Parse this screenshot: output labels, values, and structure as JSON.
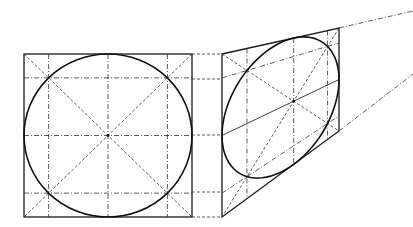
{
  "figure": {
    "colors": {
      "ink": "#1a1a1a",
      "background": "#ffffff"
    }
  },
  "front_square": {
    "x0": 24,
    "y0": 54,
    "x1": 192,
    "y1": 217,
    "inner_fraction": 0.1464
  },
  "perspective_quad": {
    "tl": [
      222,
      54
    ],
    "tr": [
      339,
      28
    ],
    "br": [
      339,
      131
    ],
    "bl": [
      222,
      217
    ]
  },
  "vanishing_lines": [
    {
      "from": [
        339,
        28
      ],
      "to": [
        413,
        11
      ]
    },
    {
      "from": [
        339,
        131
      ],
      "to": [
        413,
        74
      ]
    }
  ],
  "projection_lines_y": [
    54,
    79,
    135,
    192,
    217
  ]
}
